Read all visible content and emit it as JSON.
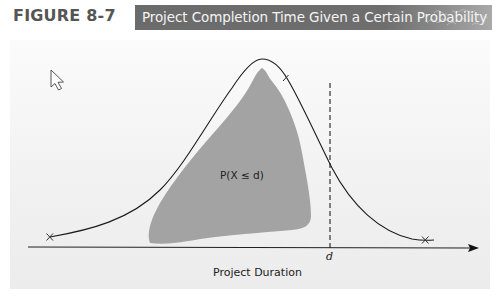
{
  "header": {
    "figure_label": "FIGURE 8-7",
    "title": "Project Completion Time Given a Certain Probability"
  },
  "diagram": {
    "shaded_region_label": "P(X ≤ d)",
    "threshold_label": "d",
    "x_axis_label": "Project Duration",
    "curve_endpoints": [
      "x-mark-left",
      "x-mark-right"
    ],
    "icons": {
      "cursor": "mouse-pointer-icon"
    },
    "colors": {
      "banner": "#6b6b6b",
      "shaded_region": "#a3a3a3",
      "curve": "#1a1a1a",
      "panel": "#f1f1f1"
    }
  }
}
